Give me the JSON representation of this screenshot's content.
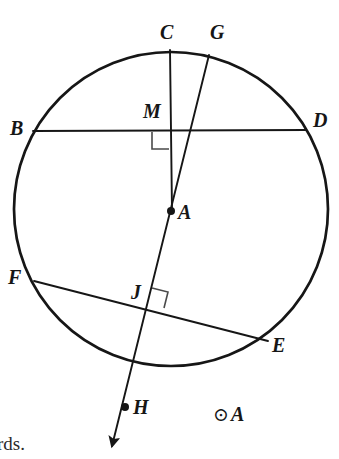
{
  "figure": {
    "type": "geometry-diagram",
    "canvas": {
      "width": 339,
      "height": 459
    },
    "stroke_color": "#161616",
    "background_color": "#ffffff",
    "circle": {
      "name": "circle-A",
      "center_label": "A",
      "cx": 171,
      "cy": 209,
      "r": 157,
      "stroke_width": 2.6
    },
    "points": [
      {
        "id": "C",
        "label": "C",
        "x": 170,
        "y": 50,
        "label_x": 160,
        "label_y": 22,
        "dot": false
      },
      {
        "id": "G",
        "label": "G",
        "x": 209,
        "y": 55,
        "label_x": 210,
        "label_y": 22,
        "dot": false
      },
      {
        "id": "B",
        "label": "B",
        "x": 33,
        "y": 131,
        "label_x": 10,
        "label_y": 118,
        "dot": false
      },
      {
        "id": "D",
        "label": "D",
        "x": 306,
        "y": 130,
        "label_x": 314,
        "label_y": 110,
        "dot": false
      },
      {
        "id": "M",
        "label": "M",
        "x": 170,
        "y": 131,
        "label_x": 145,
        "label_y": 101,
        "dot": false
      },
      {
        "id": "A",
        "label": "A",
        "x": 171,
        "y": 211,
        "label_x": 178,
        "label_y": 203,
        "dot": true
      },
      {
        "id": "F",
        "label": "F",
        "x": 34,
        "y": 281,
        "label_x": 9,
        "label_y": 267,
        "dot": false
      },
      {
        "id": "J",
        "label": "J",
        "x": 150,
        "y": 303,
        "label_x": 131,
        "label_y": 283,
        "dot": false
      },
      {
        "id": "E",
        "label": "E",
        "x": 268,
        "y": 341,
        "label_x": 273,
        "label_y": 336,
        "dot": false
      },
      {
        "id": "H",
        "label": "H",
        "x": 124,
        "y": 408,
        "label_x": 133,
        "label_y": 398,
        "dot": true
      }
    ],
    "segments": [
      {
        "name": "chord-BD",
        "from": "B",
        "to": "D",
        "x1": 33,
        "y1": 131,
        "x2": 306,
        "y2": 130
      },
      {
        "name": "chord-FE",
        "from": "F",
        "to": "E",
        "x1": 34,
        "y1": 281,
        "x2": 268,
        "y2": 341
      },
      {
        "name": "segment-CA",
        "from": "C",
        "to": "A",
        "x1": 170,
        "y1": 50,
        "x2": 172,
        "y2": 211
      }
    ],
    "ray": {
      "name": "ray-GH",
      "from": "G",
      "through": [
        "A",
        "J"
      ],
      "to": "arrowhead",
      "x1": 209,
      "y1": 55,
      "x2": 110,
      "y2": 450,
      "arrow_at_end": true
    },
    "right_angles": [
      {
        "name": "right-angle-at-M",
        "at": "M",
        "x": 152,
        "y": 132,
        "size": 17,
        "rotation": 0
      },
      {
        "name": "right-angle-at-J",
        "at": "J",
        "x": 152,
        "y": 289,
        "size": 16,
        "rotation": 14
      }
    ],
    "notation": {
      "name": "circle-A-notation",
      "symbol": "⊙",
      "label": "A",
      "x": 214,
      "y": 405
    },
    "page_fragment": {
      "text": "rds.",
      "x": -4,
      "y": 434
    }
  }
}
